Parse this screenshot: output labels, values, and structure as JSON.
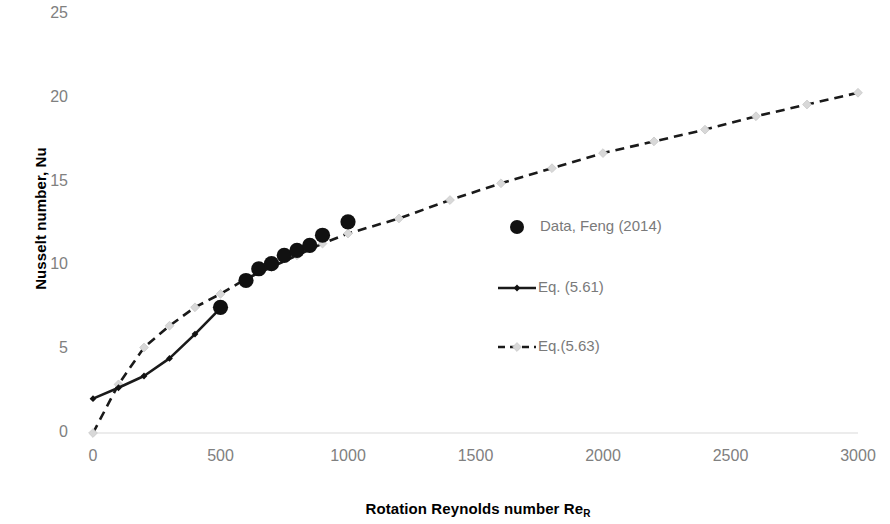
{
  "chart_data": {
    "type": "line",
    "title": "",
    "xlabel": "Rotation Reynolds number Re",
    "xlabel_sub": "R",
    "ylabel": "Nusselt number, Nu",
    "xlim": [
      0,
      3000
    ],
    "ylim": [
      0,
      25
    ],
    "xticks": [
      0,
      500,
      1000,
      1500,
      2000,
      2500,
      3000
    ],
    "yticks": [
      0,
      5,
      10,
      15,
      20,
      25
    ],
    "grid": "horizontal-baseline-only",
    "legend_position": "inside-center-right",
    "colors": {
      "data_marker": "#111111",
      "eq561_line": "#1a1a1a",
      "eq563_line": "#1a1a1a",
      "eq563_marker": "#d8d8d8",
      "tick_text": "#808080",
      "axis_title": "#000000",
      "legend_text": "#7a7a7a",
      "axis_line": "#e6e6e6"
    },
    "series": [
      {
        "name": "Data, Feng (2014)",
        "style": "scatter",
        "marker": "filled-circle",
        "x": [
          500,
          600,
          650,
          700,
          750,
          800,
          850,
          900,
          1000
        ],
        "y": [
          7.5,
          9.1,
          9.8,
          10.1,
          10.6,
          10.9,
          11.2,
          11.8,
          12.6
        ]
      },
      {
        "name": "Eq. (5.61)",
        "style": "solid-line-with-markers",
        "marker": "small-diamond",
        "x": [
          0,
          100,
          200,
          300,
          400,
          500
        ],
        "y": [
          2.05,
          2.7,
          3.4,
          4.45,
          5.9,
          7.45
        ]
      },
      {
        "name": "Eq.(5.63)",
        "style": "dashed-line-with-markers",
        "marker": "small-light-diamond",
        "x": [
          0,
          100,
          200,
          300,
          400,
          500,
          600,
          700,
          800,
          900,
          1000,
          1200,
          1400,
          1600,
          1800,
          2000,
          2200,
          2400,
          2600,
          2800,
          3000
        ],
        "y": [
          0.0,
          2.9,
          5.1,
          6.4,
          7.5,
          8.3,
          9.2,
          9.9,
          10.6,
          11.3,
          11.9,
          12.8,
          13.9,
          14.9,
          15.8,
          16.7,
          17.4,
          18.1,
          18.9,
          19.6,
          20.3
        ]
      }
    ],
    "legend": [
      {
        "label": "Data, Feng (2014)",
        "marker": "filled-circle",
        "line": "none"
      },
      {
        "label": "Eq. (5.61)",
        "marker": "small-diamond",
        "line": "solid"
      },
      {
        "label": "Eq.(5.63)",
        "marker": "small-light-diamond",
        "line": "dashed"
      }
    ]
  }
}
